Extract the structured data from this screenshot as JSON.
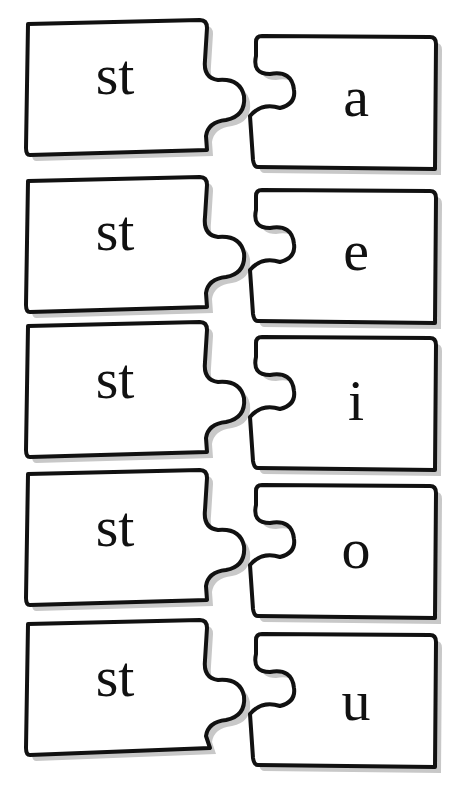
{
  "worksheet": {
    "pairs": [
      {
        "left": "st",
        "right": "a",
        "left_top": 20,
        "right_top": 36
      },
      {
        "left": "st",
        "right": "e",
        "left_top": 177,
        "right_top": 190
      },
      {
        "left": "st",
        "right": "i",
        "left_top": 322,
        "right_top": 337
      },
      {
        "left": "st",
        "right": "o",
        "left_top": 470,
        "right_top": 485
      },
      {
        "left": "st",
        "right": "u",
        "left_top": 620,
        "right_top": 634
      }
    ],
    "colors": {
      "outline": "#111111",
      "fill": "#ffffff",
      "shadow": "#c8c8c8",
      "text": "#111111"
    }
  }
}
